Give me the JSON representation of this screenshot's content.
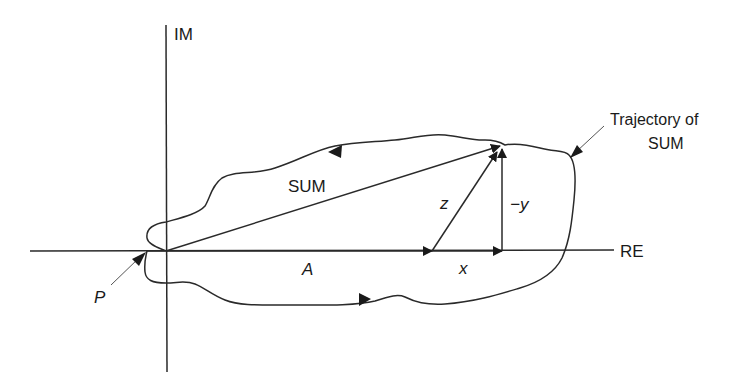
{
  "diagram": {
    "axes": {
      "imaginary_label": "IM",
      "real_label": "RE"
    },
    "vectors": {
      "sum_label": "SUM",
      "a_label": "A",
      "z_label": "z",
      "x_label": "x",
      "neg_y_label": "−y"
    },
    "annotations": {
      "trajectory_line1": "Trajectory of",
      "trajectory_line2": "SUM",
      "point_label": "P"
    },
    "colors": {
      "stroke": "#2a2a2a",
      "text": "#1a1a1a",
      "background": "#ffffff"
    }
  }
}
